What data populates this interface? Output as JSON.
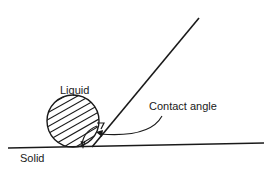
{
  "diagram": {
    "type": "contact-angle-illustration",
    "labels": {
      "liquid": "Liquid",
      "contact_angle": "Contact angle",
      "solid": "Solid"
    },
    "colors": {
      "line": "#1a1a1a",
      "background": "#ffffff"
    }
  }
}
